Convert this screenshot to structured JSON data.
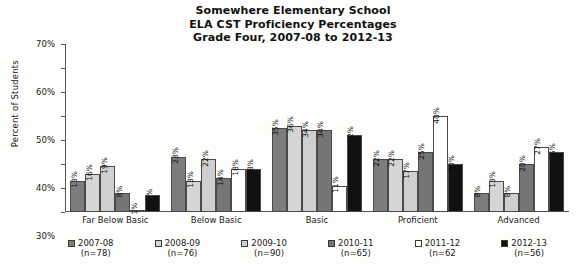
{
  "chart_data": {
    "type": "bar",
    "title": "Somewhere Elementary School\nELA CST Proficiency Percentages\nGrade Four, 2007-08 to 2012-13",
    "title_lines": [
      "Somewhere Elementary School",
      "ELA CST Proficiency Percentages",
      "Grade Four, 2007-08 to 2012-13"
    ],
    "xlabel": "",
    "ylabel": "Percent of Students",
    "ylim": [
      0,
      70
    ],
    "ytick_labels": [
      "0%",
      "10%",
      "20%",
      "30%",
      "40%",
      "50%",
      "60%",
      "70%"
    ],
    "ytick_values": [
      0,
      10,
      20,
      30,
      40,
      50,
      60,
      70
    ],
    "grid": false,
    "legend_position": "bottom",
    "categories": [
      "Far Below Basic",
      "Below Basic",
      "Basic",
      "Proficient",
      "Advanced"
    ],
    "series": [
      {
        "name": "2007-08",
        "n": "(n=78)",
        "color": "#7d7d7d",
        "values": [
          13,
          23,
          35,
          22,
          8
        ],
        "labels": [
          "13%",
          "23%",
          "35%",
          "22%",
          "8%"
        ]
      },
      {
        "name": "2008-09",
        "n": "(n=76)",
        "color": "#d5d5d5",
        "values": [
          16,
          13,
          36,
          22,
          13
        ],
        "labels": [
          "16%",
          "13%",
          "36%",
          "22%",
          "13%"
        ]
      },
      {
        "name": "2009-10",
        "n": "(n=90)",
        "color": "#cfcfcf",
        "values": [
          19,
          22,
          34,
          17,
          8
        ],
        "labels": [
          "19%",
          "22%",
          "34%",
          "17%",
          "8%"
        ]
      },
      {
        "name": "2010-11",
        "n": "(n=65)",
        "color": "#757575",
        "values": [
          8,
          14,
          34,
          25,
          20
        ],
        "labels": [
          "8%",
          "14%",
          "34%",
          "25%",
          "20%"
        ]
      },
      {
        "name": "2011-12",
        "n": "(n=62",
        "color": "#fefefe",
        "values": [
          1,
          18,
          11,
          40,
          27
        ],
        "labels": [
          "1%",
          "18%",
          "11%",
          "40%",
          "27%"
        ]
      },
      {
        "name": "2012-13",
        "n": "(n=56)",
        "color": "#111111",
        "values": [
          7,
          18,
          32,
          20,
          25
        ],
        "labels": [
          "7%",
          "18%",
          "32%",
          "20%",
          "25%"
        ]
      }
    ]
  }
}
